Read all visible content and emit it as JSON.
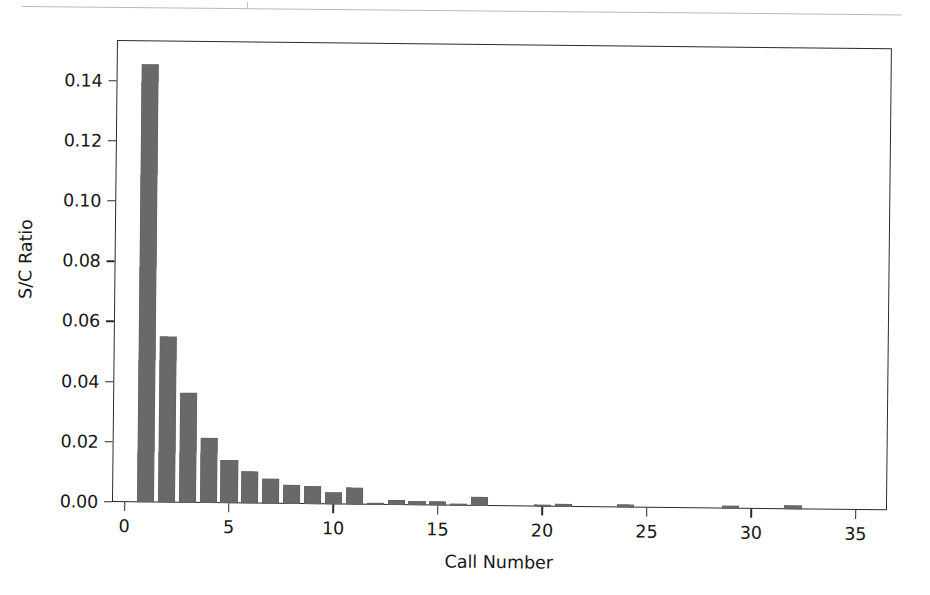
{
  "figure": {
    "bar_color": "#696969",
    "axis_color": "#2b2b2b",
    "background": "#ffffff"
  },
  "artifacts": {
    "top_rule_name": "scanned-page-rule"
  },
  "chart_data": {
    "type": "bar",
    "title": "",
    "xlabel": "Call Number",
    "ylabel": "S/C Ratio",
    "xlim": [
      -0.6,
      36.5
    ],
    "ylim": [
      0.0,
      0.1535
    ],
    "grid": false,
    "legend": null,
    "xticks": [
      0,
      5,
      10,
      15,
      20,
      25,
      30,
      35
    ],
    "xtick_labels": [
      "0",
      "5",
      "10",
      "15",
      "20",
      "25",
      "30",
      "35"
    ],
    "yticks": [
      0.0,
      0.02,
      0.04,
      0.06,
      0.08,
      0.1,
      0.12,
      0.14
    ],
    "ytick_labels": [
      "0.00",
      "0.02",
      "0.04",
      "0.06",
      "0.08",
      "0.10",
      "0.12",
      "0.14"
    ],
    "x": [
      1,
      2,
      3,
      4,
      5,
      6,
      7,
      8,
      9,
      10,
      11,
      12,
      13,
      14,
      15,
      16,
      17,
      20,
      21,
      24,
      29,
      32
    ],
    "values": [
      0.1455,
      0.0553,
      0.0366,
      0.0216,
      0.0144,
      0.0108,
      0.0082,
      0.0062,
      0.006,
      0.0039,
      0.0058,
      0.0008,
      0.0016,
      0.0015,
      0.0013,
      0.0006,
      0.0031,
      0.0008,
      0.0009,
      0.0011,
      0.001,
      0.0013
    ],
    "categories": [
      "1",
      "2",
      "3",
      "4",
      "5",
      "6",
      "7",
      "8",
      "9",
      "10",
      "11",
      "12",
      "13",
      "14",
      "15",
      "16",
      "17",
      "20",
      "21",
      "24",
      "29",
      "32"
    ],
    "bar_width": 0.82
  }
}
